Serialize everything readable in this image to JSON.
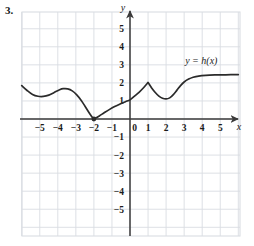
{
  "problem": {
    "number": "3."
  },
  "chart_data": {
    "type": "line",
    "title": "",
    "xlabel": "x",
    "ylabel": "y",
    "curve_label": "y = h(x)",
    "xlim": [
      -6.1,
      6.1
    ],
    "ylim": [
      -6.1,
      6.1
    ],
    "grid": true,
    "grid_step": 1,
    "legend_position": "upper-right-inside",
    "xticks": [
      -5,
      -4,
      -3,
      -2,
      -1,
      0,
      1,
      2,
      3,
      4,
      5
    ],
    "xtick_labels": [
      "−5",
      "−4",
      "−3",
      "−2",
      "−1",
      "0",
      "1",
      "2",
      "3",
      "4",
      "5"
    ],
    "yticks": [
      5,
      4,
      3,
      2,
      1,
      -1,
      -2,
      -3,
      -4,
      -5
    ],
    "ytick_labels": [
      "5",
      "4",
      "3",
      "2",
      "1",
      "−1",
      "−2",
      "−3",
      "−4",
      "−5"
    ],
    "series": [
      {
        "name": "h(x)",
        "color": "#2b2b2b",
        "points": [
          [
            -6.0,
            1.85
          ],
          [
            -5.7,
            1.58
          ],
          [
            -5.4,
            1.36
          ],
          [
            -5.1,
            1.26
          ],
          [
            -4.8,
            1.25
          ],
          [
            -4.5,
            1.32
          ],
          [
            -4.2,
            1.47
          ],
          [
            -3.9,
            1.62
          ],
          [
            -3.7,
            1.68
          ],
          [
            -3.45,
            1.67
          ],
          [
            -3.2,
            1.56
          ],
          [
            -2.95,
            1.34
          ],
          [
            -2.7,
            1.03
          ],
          [
            -2.45,
            0.64
          ],
          [
            -2.22,
            0.28
          ],
          [
            -2.05,
            0.04
          ],
          [
            -2.0,
            0.0
          ],
          [
            -1.9,
            0.05
          ],
          [
            -1.7,
            0.17
          ],
          [
            -1.45,
            0.33
          ],
          [
            -1.15,
            0.52
          ],
          [
            -0.85,
            0.69
          ],
          [
            -0.55,
            0.83
          ],
          [
            -0.25,
            0.96
          ],
          [
            0.0,
            1.06
          ],
          [
            0.25,
            1.27
          ],
          [
            0.5,
            1.48
          ],
          [
            0.75,
            1.73
          ],
          [
            1.0,
            2.02
          ],
          [
            1.2,
            1.72
          ],
          [
            1.4,
            1.47
          ],
          [
            1.6,
            1.27
          ],
          [
            1.8,
            1.15
          ],
          [
            2.0,
            1.11
          ],
          [
            2.2,
            1.17
          ],
          [
            2.4,
            1.35
          ],
          [
            2.6,
            1.6
          ],
          [
            2.8,
            1.85
          ],
          [
            3.0,
            2.05
          ],
          [
            3.25,
            2.21
          ],
          [
            3.5,
            2.31
          ],
          [
            3.8,
            2.38
          ],
          [
            4.2,
            2.42
          ],
          [
            4.7,
            2.44
          ],
          [
            5.3,
            2.45
          ],
          [
            6.0,
            2.46
          ]
        ],
        "markers": [
          {
            "x": -2.0,
            "y": 0.0,
            "style": "filled-dot"
          }
        ]
      }
    ],
    "annotations": [
      {
        "text": "y = h(x)",
        "x": 3.95,
        "y": 3.05
      }
    ]
  },
  "colors": {
    "grid": "#d9dde2",
    "axis": "#3a3a3a",
    "curve": "#2b2b2b",
    "background": "#ffffff",
    "text": "#1a1a1a"
  }
}
